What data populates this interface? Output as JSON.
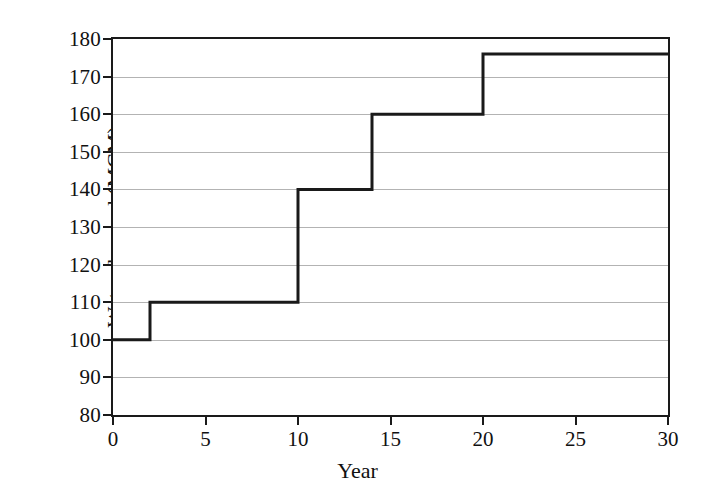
{
  "chart_data": {
    "type": "line",
    "subtype": "step-post",
    "title": "",
    "xlabel": "Year",
    "ylabel": "Water demand (MCM)",
    "xlim": [
      0,
      30
    ],
    "ylim": [
      80,
      180
    ],
    "xticks": [
      0,
      5,
      10,
      15,
      20,
      25,
      30
    ],
    "yticks": [
      80,
      90,
      100,
      110,
      120,
      130,
      140,
      150,
      160,
      170,
      180
    ],
    "xtick_labels": [
      "0",
      "5",
      "10",
      "15",
      "20",
      "25",
      "30"
    ],
    "ytick_labels": [
      "80",
      "90",
      "100",
      "110",
      "120",
      "130",
      "140",
      "150",
      "160",
      "170",
      "180"
    ],
    "grid": "horizontal",
    "legend": "none",
    "line_color": "#1a1a1a",
    "grid_color": "#9a9a9a",
    "steps": [
      {
        "x_start": 0,
        "x_end": 2,
        "value": 100
      },
      {
        "x_start": 2,
        "x_end": 10,
        "value": 110
      },
      {
        "x_start": 10,
        "x_end": 14,
        "value": 140
      },
      {
        "x_start": 14,
        "x_end": 20,
        "value": 160
      },
      {
        "x_start": 20,
        "x_end": 30,
        "value": 176
      }
    ],
    "x": [
      0,
      2,
      2,
      10,
      10,
      14,
      14,
      20,
      20,
      30
    ],
    "y": [
      100,
      100,
      110,
      110,
      140,
      140,
      160,
      160,
      176,
      176
    ]
  }
}
